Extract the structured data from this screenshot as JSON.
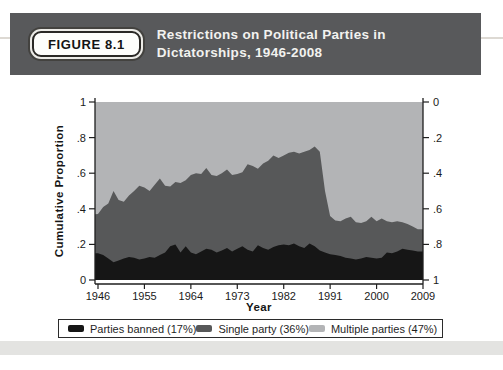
{
  "header": {
    "badge_label": "FIGURE 8.1",
    "title_line1": "Restrictions on Political Parties in",
    "title_line2": "Dictatorships, 1946-2008"
  },
  "chart_data": {
    "type": "area",
    "subtype": "stacked-cumulative-proportion",
    "title": "Restrictions on Political Parties in Dictatorships, 1946-2008",
    "years": {
      "start": 1946,
      "end": 2008
    },
    "x_axis": {
      "label": "Year",
      "ticks": [
        1946,
        1955,
        1964,
        1973,
        1982,
        1991,
        2000,
        2009
      ],
      "range": [
        1946,
        2009
      ]
    },
    "y_axis_left": {
      "label": "Cumulative Proportion",
      "ticks": [
        "1",
        ".8",
        ".6",
        ".4",
        ".2",
        "0"
      ],
      "range": [
        0,
        1
      ],
      "direction": "values increase upward"
    },
    "y_axis_right": {
      "ticks": [
        "0",
        ".2",
        ".4",
        ".6",
        ".8",
        "1"
      ],
      "range": [
        0,
        1
      ],
      "direction": "inverted, values increase downward"
    },
    "grid": "off",
    "legend_position": "bottom, boxed, horizontal",
    "series": [
      {
        "name": "Parties banned (17%)",
        "color": "#161616",
        "cumulative_top": [
          0.15,
          0.14,
          0.12,
          0.1,
          0.11,
          0.12,
          0.13,
          0.125,
          0.115,
          0.12,
          0.13,
          0.125,
          0.14,
          0.155,
          0.19,
          0.2,
          0.155,
          0.19,
          0.155,
          0.145,
          0.16,
          0.175,
          0.17,
          0.155,
          0.165,
          0.18,
          0.16,
          0.175,
          0.19,
          0.17,
          0.16,
          0.195,
          0.18,
          0.17,
          0.185,
          0.195,
          0.2,
          0.195,
          0.205,
          0.19,
          0.18,
          0.205,
          0.19,
          0.165,
          0.155,
          0.145,
          0.14,
          0.135,
          0.125,
          0.12,
          0.115,
          0.12,
          0.13,
          0.125,
          0.12,
          0.125,
          0.155,
          0.15,
          0.16,
          0.175,
          0.17,
          0.165,
          0.16
        ]
      },
      {
        "name": "Single party (36%)",
        "color": "#575859",
        "cumulative_top": [
          0.37,
          0.41,
          0.43,
          0.5,
          0.45,
          0.44,
          0.475,
          0.5,
          0.53,
          0.52,
          0.5,
          0.535,
          0.57,
          0.53,
          0.525,
          0.55,
          0.545,
          0.56,
          0.59,
          0.6,
          0.595,
          0.63,
          0.59,
          0.585,
          0.6,
          0.62,
          0.59,
          0.595,
          0.605,
          0.65,
          0.64,
          0.625,
          0.655,
          0.67,
          0.7,
          0.685,
          0.7,
          0.715,
          0.72,
          0.71,
          0.72,
          0.73,
          0.75,
          0.72,
          0.5,
          0.36,
          0.335,
          0.33,
          0.345,
          0.355,
          0.325,
          0.32,
          0.33,
          0.355,
          0.33,
          0.345,
          0.33,
          0.325,
          0.33,
          0.325,
          0.315,
          0.3,
          0.285
        ]
      },
      {
        "name": "Multiple parties (47%)",
        "color": "#b3b4b6",
        "cumulative_top_constant": 1
      }
    ]
  }
}
